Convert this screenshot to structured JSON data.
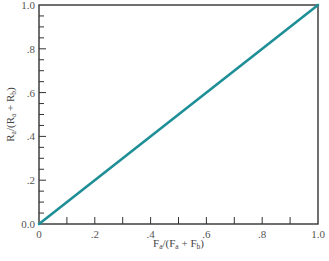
{
  "chart_data": {
    "type": "line",
    "title": "",
    "xlabel": "F_a/(F_a + F_b)",
    "ylabel": "R_a/(R_a + R_b)",
    "xlim": [
      0,
      1.0
    ],
    "ylim": [
      0,
      1.0
    ],
    "grid": false,
    "legend": null,
    "x_ticks_major": [
      "0",
      ".2",
      ".4",
      ".6",
      ".8",
      "1.0"
    ],
    "y_ticks_major": [
      "0.0",
      ".2",
      ".4",
      ".6",
      ".8",
      "1.0"
    ],
    "minor_ticks_x_step": 0.1,
    "minor_ticks_y_step": 0.05,
    "series": [
      {
        "name": "ratio",
        "color": "#1e8f96",
        "x": [
          0,
          1.0
        ],
        "y": [
          0,
          1.0
        ]
      }
    ]
  },
  "colors": {
    "line": "#1e8f96",
    "axis": "#333333",
    "text": "#555555"
  },
  "labels": {
    "x_main": "F",
    "x_sub_a": "a",
    "x_mid": "/(F",
    "x_sub_a2": "a",
    "x_plus": " + F",
    "x_sub_b": "b",
    "x_end": ")",
    "y_main": "R",
    "y_sub_a": "a",
    "y_mid": "/(R",
    "y_sub_a2": "a",
    "y_plus": " + R",
    "y_sub_b": "b",
    "y_end": ")"
  }
}
